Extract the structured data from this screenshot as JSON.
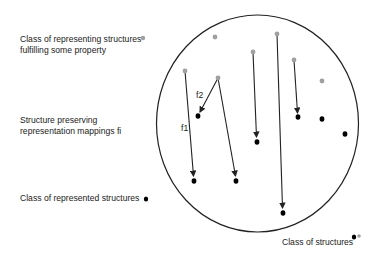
{
  "legend": {
    "representing": {
      "line1": "Class of representing structures",
      "line2": "fulfilling some property"
    },
    "mappings": {
      "line1": "Structure preserving",
      "line2": "representation mappings fi"
    },
    "represented": {
      "label": "Class of represented structures"
    },
    "structures": {
      "label": "Class of structures"
    }
  },
  "arrow_labels": {
    "f1": "f1",
    "f2": "f2"
  },
  "colors": {
    "representing": "#a0a0a0",
    "represented": "#000000",
    "circle": "#222222",
    "arrow": "#222222"
  }
}
